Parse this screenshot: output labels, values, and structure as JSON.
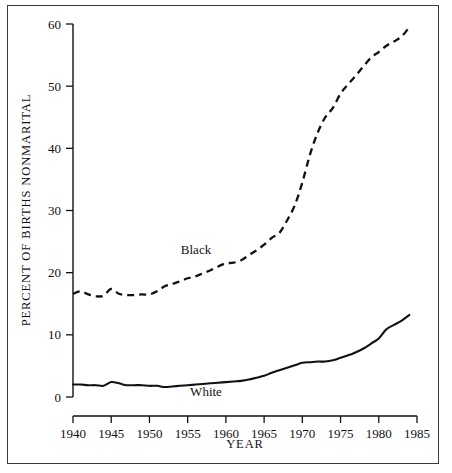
{
  "chart_data": {
    "type": "line",
    "title": "",
    "subtitle": "",
    "xlabel": "YEAR",
    "ylabel": "PERCENT OF BIRTHS NONMARITAL",
    "xlim": [
      1940,
      1985
    ],
    "ylim": [
      0,
      60
    ],
    "xticks": [
      1940,
      1945,
      1950,
      1955,
      1960,
      1965,
      1970,
      1975,
      1980,
      1985
    ],
    "yticks": [
      0,
      10,
      20,
      30,
      40,
      50,
      60
    ],
    "xtick_labels": [
      "1940",
      "1945",
      "1950",
      "1955",
      "1960",
      "1965",
      "1970",
      "1975",
      "1980",
      "1985"
    ],
    "ytick_labels": [
      "0",
      "10",
      "20",
      "30",
      "40",
      "50",
      "60"
    ],
    "grid": false,
    "legend_position": "inline-annotation",
    "x": [
      1940,
      1941,
      1942,
      1943,
      1944,
      1945,
      1946,
      1947,
      1948,
      1949,
      1950,
      1951,
      1952,
      1953,
      1954,
      1955,
      1956,
      1957,
      1958,
      1959,
      1960,
      1961,
      1962,
      1963,
      1964,
      1965,
      1966,
      1967,
      1968,
      1969,
      1970,
      1971,
      1972,
      1973,
      1974,
      1975,
      1976,
      1977,
      1978,
      1979,
      1980,
      1981,
      1982,
      1983,
      1984
    ],
    "series": [
      {
        "name": "Black",
        "style": "dashed",
        "color": "#111111",
        "label_text": "Black",
        "values": [
          16.6,
          17.0,
          16.5,
          16.2,
          16.3,
          17.4,
          16.6,
          16.4,
          16.4,
          16.5,
          16.5,
          17.0,
          17.8,
          18.2,
          18.6,
          19.1,
          19.4,
          19.9,
          20.4,
          21.0,
          21.5,
          21.6,
          22.0,
          22.8,
          23.6,
          24.5,
          25.6,
          26.4,
          28.4,
          30.8,
          34.5,
          39.0,
          42.5,
          45.0,
          46.5,
          48.8,
          50.3,
          51.7,
          53.2,
          54.6,
          55.5,
          56.5,
          57.2,
          58.0,
          59.5
        ]
      },
      {
        "name": "White",
        "style": "solid",
        "color": "#111111",
        "label_text": "White",
        "values": [
          2.0,
          2.0,
          1.9,
          1.9,
          1.8,
          2.4,
          2.2,
          1.9,
          1.9,
          1.9,
          1.8,
          1.8,
          1.6,
          1.7,
          1.8,
          1.9,
          2.0,
          2.1,
          2.2,
          2.3,
          2.4,
          2.5,
          2.6,
          2.8,
          3.1,
          3.4,
          3.9,
          4.3,
          4.7,
          5.1,
          5.5,
          5.6,
          5.7,
          5.7,
          5.9,
          6.3,
          6.7,
          7.2,
          7.8,
          8.6,
          9.4,
          10.9,
          11.6,
          12.3,
          13.2
        ]
      }
    ]
  },
  "annotations": {
    "black_label": "Black",
    "white_label": "White"
  },
  "axes": {
    "y_axis_title": "PERCENT OF BIRTHS NONMARITAL",
    "x_axis_title": "YEAR"
  }
}
